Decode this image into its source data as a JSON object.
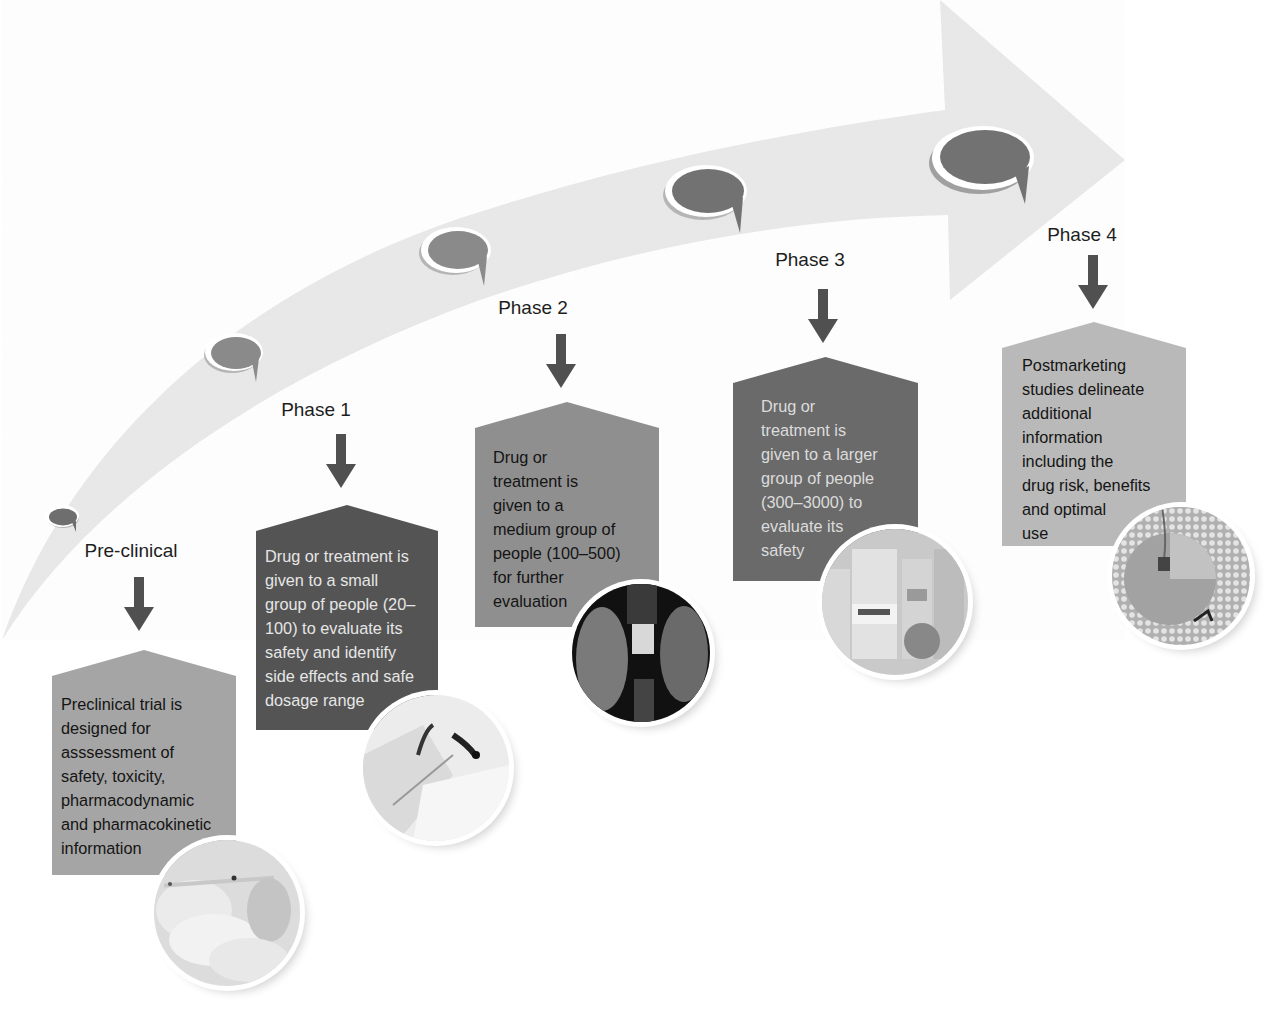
{
  "diagram": {
    "type": "clinical-trial-phases-timeline",
    "colors": {
      "background": "#ffffff",
      "arrow_band": "#e9e9e9",
      "bubble_fill": "#7d7d7d",
      "bubble_rim": "#ffffff",
      "down_arrow": "#505050",
      "label_text": "#1e1e1e"
    },
    "stages": [
      {
        "id": "preclinical",
        "label": "Pre-clinical",
        "description": "Preclinical trial is\ndesigned for\nasssessment of\nsafety, toxicity,\npharmacodynamic\nand pharmacokinetic\ninformation",
        "box_color": "#a5a5a5",
        "text_color": "#141414",
        "photo": "gloved-hands-syringe-photo"
      },
      {
        "id": "phase1",
        "label": "Phase 1",
        "description": "Drug or treatment is\ngiven to a small\ngroup of people (20–\n100) to evaluate its\nsafety and identify\nside effects and safe\ndosage range",
        "box_color": "#545454",
        "text_color": "#e6e6e6",
        "photo": "patient-examination-photo"
      },
      {
        "id": "phase2",
        "label": "Phase 2",
        "description": "Drug or\ntreatment is\ngiven to a\nmedium group of\npeople (100–500)\nfor further\nevaluation",
        "box_color": "#8f8f8f",
        "text_color": "#141414",
        "photo": "vial-and-syringe-photo"
      },
      {
        "id": "phase3",
        "label": "Phase 3",
        "description": "Drug or\ntreatment is\ngiven to a larger\ngroup of people\n(300–3000) to\nevaluate its\nsafety",
        "box_color": "#6a6a6a",
        "text_color": "#dcdcdc",
        "photo": "medicine-vials-photo"
      },
      {
        "id": "phase4",
        "label": "Phase 4",
        "description": "Postmarketing\nstudies delineate\nadditional\ninformation\nincluding the\ndrug risk, benefits\nand optimal\nuse",
        "box_color": "#b9b9b9",
        "text_color": "#141414",
        "photo": "pill-manufacturing-machine-photo"
      }
    ]
  }
}
